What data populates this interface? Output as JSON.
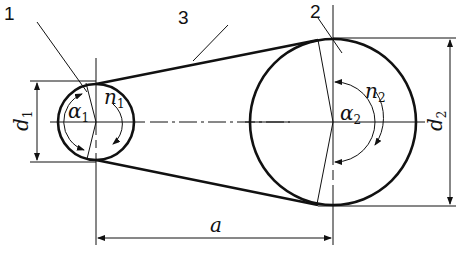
{
  "diagram": {
    "type": "belt-drive",
    "callouts": [
      {
        "id": "1",
        "label": "1",
        "target": "small-pulley"
      },
      {
        "id": "2",
        "label": "2",
        "target": "large-pulley"
      },
      {
        "id": "3",
        "label": "3",
        "target": "belt"
      }
    ],
    "small_pulley": {
      "diameter_symbol": "d",
      "diameter_sub": "1",
      "angle_symbol": "α",
      "angle_sub": "1",
      "speed_symbol": "n",
      "speed_sub": "1"
    },
    "large_pulley": {
      "diameter_symbol": "d",
      "diameter_sub": "2",
      "angle_symbol": "α",
      "angle_sub": "2",
      "speed_symbol": "n",
      "speed_sub": "2"
    },
    "center_distance": {
      "symbol": "a"
    },
    "colors": {
      "stroke": "#111111",
      "background": "#ffffff"
    }
  }
}
